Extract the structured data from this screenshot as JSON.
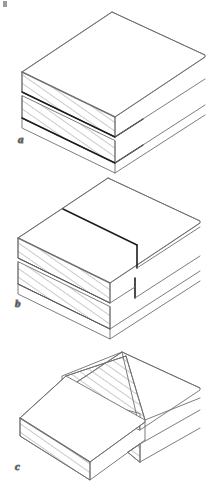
{
  "figure": {
    "background_color": "#ffffff",
    "outline_color": "#6e6e72",
    "hatch_color": "#8a8a90",
    "kerf_color": "#1c1c1c",
    "label_color": "#1b1b1b",
    "panel_count": 3
  },
  "panels": [
    {
      "id": "a",
      "label": "a",
      "caption": "Board end with two shallow saw kerfs started on the end grain",
      "label_x": 18,
      "label_y": 143,
      "hatched_faces": 2,
      "kerf_lines": 2,
      "kerf_depth_note": "kerfs run partway along the board length"
    },
    {
      "id": "b",
      "label": "b",
      "caption": "Kerfs cut to full depth and stopped with vertical shoulder marks",
      "label_x": 15,
      "label_y": 307,
      "hatched_faces": 2,
      "kerf_lines": 2,
      "kerf_depth_note": "cuts terminate at short vertical stop lines"
    },
    {
      "id": "c",
      "label": "c",
      "caption": "Waste removed leaving a stepped tongue with hatched cut faces",
      "label_x": 15,
      "label_y": 470,
      "hatched_faces": 2,
      "kerf_lines": 0,
      "kerf_depth_note": "material between kerfs pared away"
    }
  ],
  "artifact": {
    "name": "scan-speck",
    "visible": true
  }
}
